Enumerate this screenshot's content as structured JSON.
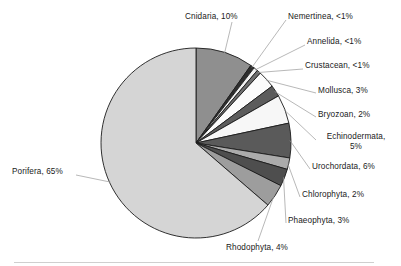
{
  "chart_data": {
    "type": "pie",
    "title": "",
    "subtitle": "",
    "xlabel": "",
    "ylabel": "",
    "legend_position": "callout-labels",
    "grid": false,
    "start_angle_deg": 0,
    "direction": "clockwise",
    "center": {
      "x": 196,
      "y": 143
    },
    "radius": 95,
    "categories": [
      "Cnidaria",
      "Nemertinea",
      "Annelida",
      "Crustacean",
      "Mollusca",
      "Bryozoan",
      "Echinodermata",
      "Urochordata",
      "Chlorophyta",
      "Phaeophyta",
      "Rhodophyta",
      "Porifera"
    ],
    "values": [
      10,
      0.7,
      0.7,
      0.7,
      3,
      2,
      5,
      6,
      2,
      3,
      4,
      65
    ],
    "value_labels": [
      "10%",
      "<1%",
      "<1%",
      "<1%",
      "3%",
      "2%",
      "5%",
      "6%",
      "2%",
      "3%",
      "4%",
      "65%"
    ],
    "colors": [
      "#8f8f8f",
      "#2e2e2e",
      "#f2f2f2",
      "#6e6e6e",
      "#fbfbfb",
      "#5c5c5c",
      "#f7f7f7",
      "#5a5a5a",
      "#ababab",
      "#4e4e4e",
      "#9d9d9d",
      "#d5d5d5"
    ],
    "slice_border_color": "#1c1c1c",
    "slices": [
      {
        "label": "Cnidaria, 10%",
        "name": "Cnidaria",
        "value": 10,
        "value_text": "10%",
        "color": "#8f8f8f"
      },
      {
        "label": "Nemertinea, <1%",
        "name": "Nemertinea",
        "value": 0.7,
        "value_text": "<1%",
        "color": "#2e2e2e"
      },
      {
        "label": "Annelida, <1%",
        "name": "Annelida",
        "value": 0.7,
        "value_text": "<1%",
        "color": "#f2f2f2"
      },
      {
        "label": "Crustacean, <1%",
        "name": "Crustacean",
        "value": 0.7,
        "value_text": "<1%",
        "color": "#6e6e6e"
      },
      {
        "label": "Mollusca, 3%",
        "name": "Mollusca",
        "value": 3,
        "value_text": "3%",
        "color": "#fbfbfb"
      },
      {
        "label": "Bryozoan, 2%",
        "name": "Bryozoan",
        "value": 2,
        "value_text": "2%",
        "color": "#5c5c5c"
      },
      {
        "label": "Echinodermata, 5%",
        "name": "Echinodermata",
        "value": 5,
        "value_text": "5%",
        "color": "#f7f7f7"
      },
      {
        "label": "Urochordata, 6%",
        "name": "Urochordata",
        "value": 6,
        "value_text": "6%",
        "color": "#5a5a5a"
      },
      {
        "label": "Chlorophyta, 2%",
        "name": "Chlorophyta",
        "value": 2,
        "value_text": "2%",
        "color": "#ababab"
      },
      {
        "label": "Phaeophyta, 3%",
        "name": "Phaeophyta",
        "value": 3,
        "value_text": "3%",
        "color": "#4e4e4e"
      },
      {
        "label": "Rhodophyta, 4%",
        "name": "Rhodophyta",
        "value": 4,
        "value_text": "4%",
        "color": "#9d9d9d"
      },
      {
        "label": "Porifera, 65%",
        "name": "Porifera",
        "value": 65,
        "value_text": "65%",
        "color": "#d5d5d5"
      }
    ]
  },
  "labels": {
    "cnidaria": "Cnidaria, 10%",
    "nemertinea": "Nemertinea, <1%",
    "annelida": "Annelida, <1%",
    "crustacean": "Crustacean, <1%",
    "mollusca": "Mollusca, 3%",
    "bryozoan": "Bryozoan, 2%",
    "echinodermata_line1": "Echinodermata,",
    "echinodermata_line2": "5%",
    "urochordata": "Urochordata, 6%",
    "chlorophyta": "Chlorophyta, 2%",
    "phaeophyta": "Phaeophyta, 3%",
    "rhodophyta": "Rhodophyta, 4%",
    "porifera": "Porifera, 65%"
  }
}
